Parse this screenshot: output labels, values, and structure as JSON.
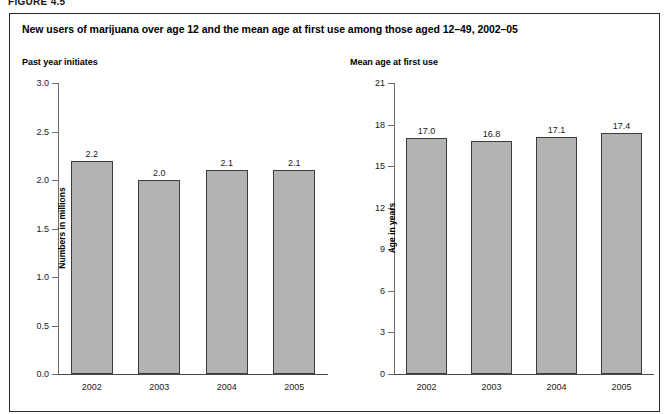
{
  "figure": {
    "label": "FIGURE 4.5",
    "title": "New users of marijuana over age 12 and the mean age at first use among those aged 12–49, 2002–05"
  },
  "colors": {
    "bar_fill": "#b3b3b3",
    "bar_border": "#3c3c3c",
    "axis": "#6e6e6e",
    "frame": "#2b2b2b",
    "text": "#000000"
  },
  "chart_data": [
    {
      "type": "bar",
      "title": "Past year initiates",
      "xlabel": "",
      "ylabel": "Numbers in millions",
      "categories": [
        "2002",
        "2003",
        "2004",
        "2005"
      ],
      "values": [
        2.2,
        2.0,
        2.1,
        2.1
      ],
      "value_labels": [
        "2.2",
        "2.0",
        "2.1",
        "2.1"
      ],
      "ylim": [
        0.0,
        3.0
      ],
      "yticks": [
        3.0,
        2.5,
        2.0,
        1.5,
        1.0,
        0.5,
        0.0
      ],
      "ytick_labels": [
        "3.0",
        "2.5",
        "2.0",
        "1.5",
        "1.0",
        "0.5",
        "0.0"
      ],
      "grid": false,
      "legend": false
    },
    {
      "type": "bar",
      "title": "Mean age at first use",
      "xlabel": "",
      "ylabel": "Age in years",
      "categories": [
        "2002",
        "2003",
        "2004",
        "2005"
      ],
      "values": [
        17.0,
        16.8,
        17.1,
        17.4
      ],
      "value_labels": [
        "17.0",
        "16.8",
        "17.1",
        "17.4"
      ],
      "ylim": [
        0,
        21
      ],
      "yticks": [
        21,
        18,
        15,
        12,
        9,
        6,
        3,
        0
      ],
      "ytick_labels": [
        "21",
        "18",
        "15",
        "12",
        "9",
        "6",
        "3",
        "0"
      ],
      "grid": false,
      "legend": false
    }
  ]
}
